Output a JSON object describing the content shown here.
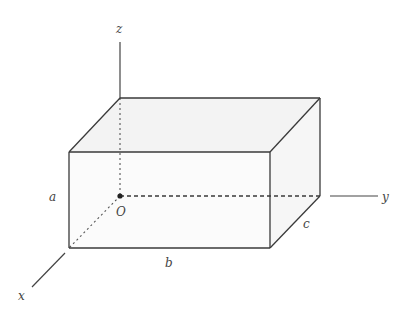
{
  "diagram": {
    "colors": {
      "line": "#3a3a3a",
      "face_fill": "#f4f4f4",
      "background": "#ffffff"
    },
    "axes": {
      "z": {
        "label": "z"
      },
      "y": {
        "label": "y"
      },
      "x": {
        "label": "x"
      }
    },
    "origin": {
      "label": "O"
    },
    "dimensions": {
      "height": {
        "label": "a"
      },
      "length": {
        "label": "b"
      },
      "depth": {
        "label": "c"
      }
    }
  }
}
